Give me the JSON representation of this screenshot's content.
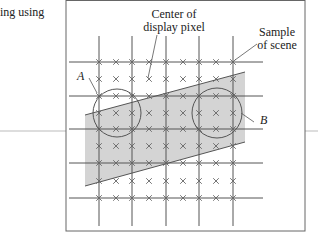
{
  "caption": "ing using",
  "labels": {
    "center_line1": "Center of",
    "center_line2": "display pixel",
    "sample_line1": "Sample",
    "sample_line2": "of scene",
    "A": "A",
    "B": "B"
  },
  "colors": {
    "line": "#555555",
    "shade": "#d4d4d4",
    "cross": "#666666"
  }
}
